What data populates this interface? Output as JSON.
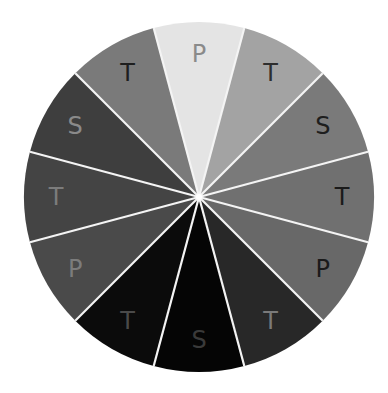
{
  "wheel": {
    "center": [
      199,
      197
    ],
    "radius": 175,
    "start_angle_deg": -15,
    "separator_color": "#f4f4f4",
    "label_radius": 143,
    "segments": [
      {
        "label": "P",
        "fill": "#e4e4e4",
        "text_color": "#8a8a8a"
      },
      {
        "label": "T",
        "fill": "#a3a3a3",
        "text_color": "#2e2e2e"
      },
      {
        "label": "S",
        "fill": "#7a7a7a",
        "text_color": "#1e1e1e"
      },
      {
        "label": "T",
        "fill": "#707070",
        "text_color": "#1a1a1a"
      },
      {
        "label": "P",
        "fill": "#686868",
        "text_color": "#1a1a1a"
      },
      {
        "label": "T",
        "fill": "#282828",
        "text_color": "#7a7a7a"
      },
      {
        "label": "S",
        "fill": "#050505",
        "text_color": "#3a3a3a"
      },
      {
        "label": "T",
        "fill": "#0b0b0b",
        "text_color": "#4a4a4a"
      },
      {
        "label": "P",
        "fill": "#4a4a4a",
        "text_color": "#7c7c7c"
      },
      {
        "label": "T",
        "fill": "#444444",
        "text_color": "#7c7c7c"
      },
      {
        "label": "S",
        "fill": "#3e3e3e",
        "text_color": "#8a8a8a"
      },
      {
        "label": "T",
        "fill": "#7a7a7a",
        "text_color": "#1e1e1e"
      }
    ]
  }
}
